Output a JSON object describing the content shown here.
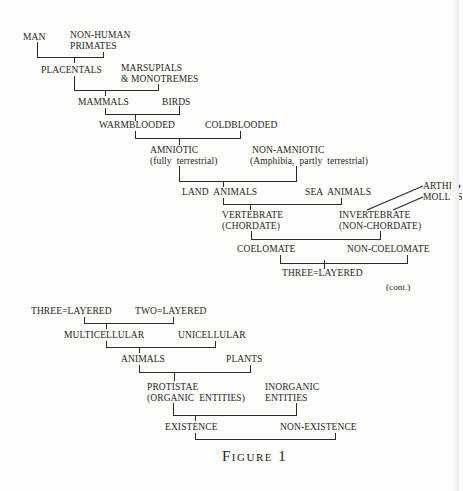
{
  "figure": {
    "caption": "Figure 1",
    "continuation_note": "(cont.)",
    "part1": {
      "nodes": {
        "man": "MAN",
        "non_human_primates_1": "NON-HUMAN",
        "non_human_primates_2": "PRIMATES",
        "placentals": "PLACENTALS",
        "marsupials_1": "MARSUPIALS",
        "marsupials_2": "& MONOTREMES",
        "mammals": "MAMMALS",
        "birds": "BIRDS",
        "warmblooded": "WARMBLOODED",
        "coldblooded": "COLDBLOODED",
        "amniotic_1": "AMNIOTIC",
        "amniotic_2": "(fully  terrestrial)",
        "non_amniotic_1": "NON-AMNIOTIC",
        "non_amniotic_2": "(Amphibia,  partly  terrestrial)",
        "land_animals": "LAND  ANIMALS",
        "sea_animals": "SEA  ANIMALS",
        "arthropoda": "ARTHR●",
        "mollusca": "MOLLUS",
        "vertebrate_1": "VERTEBRATE",
        "vertebrate_2": "(CHORDATE)",
        "invertebrate_1": "INVERTEBRATE",
        "invertebrate_2": "(NON-CHORDATE)",
        "coelomate": "COELOMATE",
        "non_coelomate": "NON-COELOMATE",
        "three_layered": "THREE=LAYERED"
      }
    },
    "part2": {
      "nodes": {
        "three_layered": "THREE=LAYERED",
        "two_layered": "TWO=LAYERED",
        "multicellular": "MULTICELLULAR",
        "unicellular": "UNICELLULAR",
        "animals": "ANIMALS",
        "plants": "PLANTS",
        "protistae_1": "PROTISTAE",
        "protistae_2": "(ORGANIC  ENTITIES)",
        "inorganic_1": "INORGANIC",
        "inorganic_2": "ENTITIES",
        "existence": "EXISTENCE",
        "non_existence": "NON-EXISTENCE"
      }
    }
  }
}
